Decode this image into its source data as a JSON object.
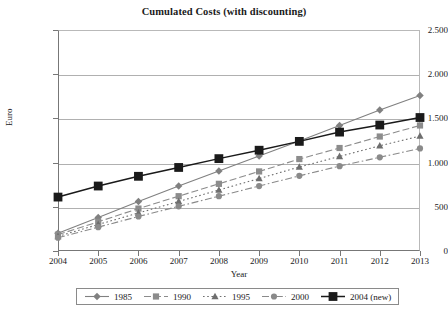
{
  "chart_data": {
    "type": "line",
    "title": "Cumulated Costs (with discounting)",
    "xlabel": "Year",
    "ylabel": "Euro",
    "categories": [
      "2004",
      "2005",
      "2006",
      "2007",
      "2008",
      "2009",
      "2010",
      "2011",
      "2012",
      "2013"
    ],
    "x": [
      2004,
      2005,
      2006,
      2007,
      2008,
      2009,
      2010,
      2011,
      2012,
      2013
    ],
    "ylim": [
      0,
      2500
    ],
    "xlim": [
      2004,
      2013
    ],
    "ytick_labels": [
      "0",
      "500",
      "1.000",
      "1.500",
      "2.000",
      "2.500"
    ],
    "ytick_values": [
      0,
      500,
      1000,
      1500,
      2000,
      2500
    ],
    "grid": true,
    "legend_position": "bottom",
    "series": [
      {
        "name": "1985",
        "marker": "diamond",
        "line_style": "solid",
        "color": "#808080",
        "values": [
          200,
          380,
          560,
          735,
          905,
          1075,
          1245,
          1420,
          1595,
          1760
        ]
      },
      {
        "name": "1990",
        "marker": "square",
        "line_style": "dashed",
        "color": "#8c8c8c",
        "values": [
          185,
          330,
          480,
          620,
          760,
          900,
          1040,
          1165,
          1295,
          1420
        ]
      },
      {
        "name": "1995",
        "marker": "triangle",
        "line_style": "dotted",
        "color": "#6e6e6e",
        "values": [
          165,
          300,
          430,
          560,
          690,
          820,
          950,
          1070,
          1190,
          1300
        ]
      },
      {
        "name": "2000",
        "marker": "circle",
        "line_style": "dash-dot",
        "color": "#8a8a8a",
        "values": [
          150,
          270,
          390,
          505,
          620,
          735,
          850,
          960,
          1060,
          1160
        ]
      },
      {
        "name": "2004 (new)",
        "marker": "filled-square",
        "line_style": "solid",
        "color": "#1a1a1a",
        "values": [
          610,
          735,
          845,
          945,
          1045,
          1140,
          1240,
          1345,
          1425,
          1510
        ]
      }
    ]
  }
}
